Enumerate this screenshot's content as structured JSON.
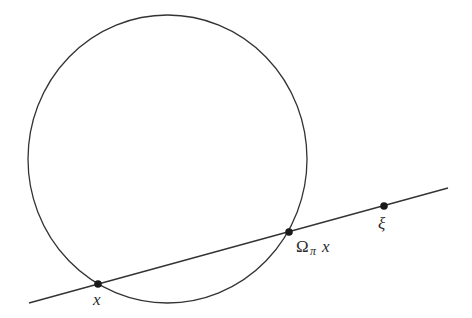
{
  "diagram": {
    "type": "geometry",
    "stroke_color": "#333333",
    "point_color": "#1a1a1a",
    "circle": {
      "cx": 167.5,
      "cy": 159,
      "rx": 139.5,
      "ry": 144
    },
    "line": {
      "x1": 29,
      "y1": 303,
      "x2": 448,
      "y2": 188
    },
    "points": [
      {
        "id": "x",
        "cx": 98,
        "cy": 284,
        "label": {
          "main": "x",
          "subscript": "",
          "suffix": ""
        }
      },
      {
        "id": "omega-pi-x",
        "cx": 289,
        "cy": 232,
        "label": {
          "main": "Ω",
          "subscript": "π",
          "suffix": "x"
        }
      },
      {
        "id": "xi",
        "cx": 384,
        "cy": 206,
        "label": {
          "main": "ξ",
          "subscript": "",
          "suffix": ""
        }
      }
    ]
  }
}
